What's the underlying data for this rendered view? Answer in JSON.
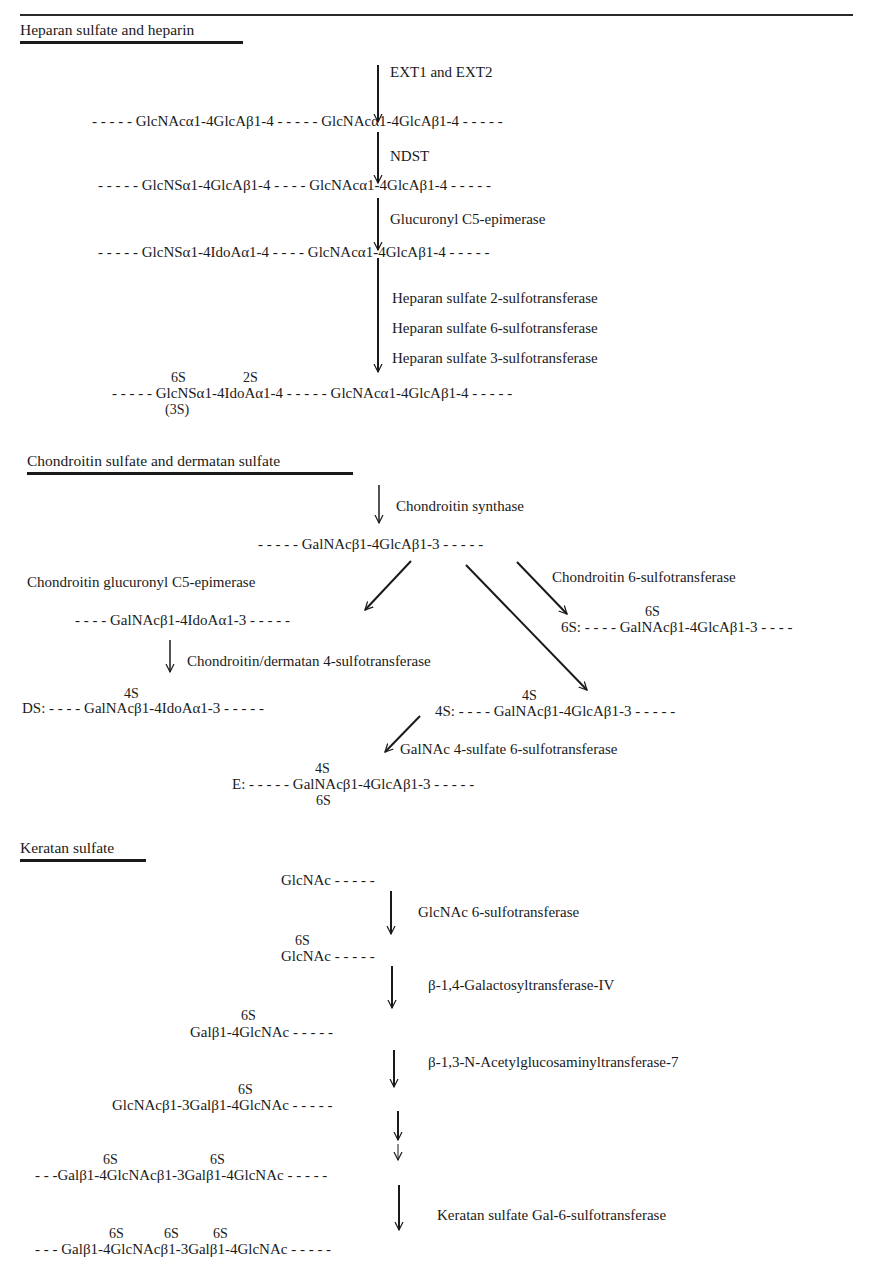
{
  "page": {
    "sections": [
      {
        "title": "Heparan sulfate and heparin",
        "enzymes": [
          "EXT1 and EXT2",
          "NDST",
          "Glucuronyl C5-epimerase",
          "Heparan sulfate 2-sulfotransferase",
          "Heparan sulfate 6-sulfotransferase",
          "Heparan sulfate 3-sulfotransferase"
        ],
        "rows": [
          {
            "left": "- - - - -  GlcNAcα1-4GlcAβ1-4    - - - - -  GlcNAcα1-4GlcAβ1-4   - - - - -"
          },
          {
            "left": "- - - - - GlcNSα1-4GlcAβ1-4   - - - -  GlcNAcα1-4GlcAβ1-4   - - - - -"
          },
          {
            "left": "- - - - -  GlcNSα1-4IdoAα1-4   - - - -  GlcNAcα1-4GlcAβ1-4   - - - - -"
          },
          {
            "left": "- - - - -  GlcNSα1-4IdoAα1-4 - - - - -   GlcNAcα1-4GlcAβ1-4   - - - - -",
            "sup1": "6S",
            "sup2": "2S",
            "sub1": "(3S)"
          }
        ]
      },
      {
        "title": "Chondroitin sulfate and dermatan sulfate",
        "enzymes": [
          "Chondroitin synthase",
          "Chondroitin glucuronyl C5-epimerase",
          "Chondroitin 6-sulfotransferase",
          "Chondroitin/dermatan 4-sulfotransferase",
          "GalNAc 4-sulfate 6-sulfotransferase"
        ],
        "rows": {
          "base": "- - - - - GalNAcβ1-4GlcAβ1-3 - - - - -",
          "ido": "- - - - GalNAcβ1-4IdoAα1-3 - - - - -",
          "six_s_sup": "6S",
          "six_s": "6S: - - - -  GalNAcβ1-4GlcAβ1-3 - - - -",
          "ds_sup": "4S",
          "ds": "DS: - - - - GalNAcβ1-4IdoAα1-3 - - - - -",
          "four_s_sup": "4S",
          "four_s": "4S: - - - -  GalNAcβ1-4GlcAβ1-3 - - - - -",
          "e_sup": "4S",
          "e": "E: - - - - - GalNAcβ1-4GlcAβ1-3 - - - - -",
          "e_sub": "6S"
        }
      },
      {
        "title": "Keratan sulfate",
        "enzymes": [
          "GlcNAc 6-sulfotransferase",
          "β-1,4-Galactosyltransferase-IV",
          "β-1,3-N-Acetylglucosaminyltransferase-7",
          "Keratan sulfate Gal-6-sulfotransferase"
        ],
        "rows": {
          "r1": "GlcNAc - - - - -",
          "r2_sup": "6S",
          "r2": "GlcNAc - - - - -",
          "r3_sup": "6S",
          "r3": "Galβ1-4GlcNAc - - - - -",
          "r4_sup": "6S",
          "r4": "GlcNAcβ1-3Galβ1-4GlcNAc - - - - -",
          "r5_sup1": "6S",
          "r5_sup2": "6S",
          "r5": "- - -Galβ1-4GlcNAcβ1-3Galβ1-4GlcNAc - - - - -",
          "r6_sup1": "6S",
          "r6_sup2": "6S",
          "r6_sup3": "6S",
          "r6": "- - - Galβ1-4GlcNAcβ1-3Galβ1-4GlcNAc - - - - -"
        }
      }
    ]
  }
}
